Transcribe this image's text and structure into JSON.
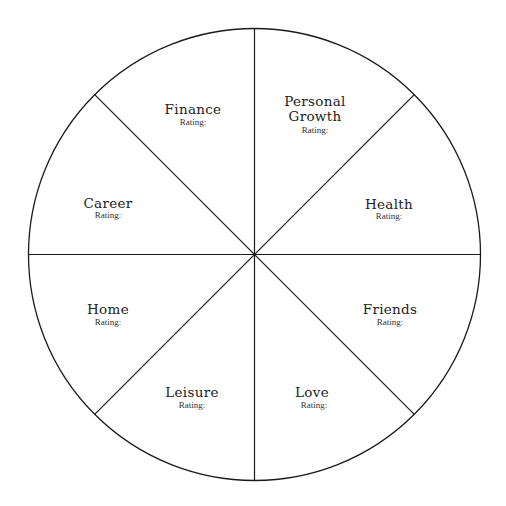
{
  "diagram": {
    "type": "wheel-of-life",
    "colors": {
      "line": "#1a1a1a",
      "background": "#ffffff",
      "text": "#222222"
    },
    "segments": [
      {
        "id": "finance",
        "title_lines": [
          "Finance"
        ],
        "rating_label": "Rating:"
      },
      {
        "id": "personal-growth",
        "title_lines": [
          "Personal",
          "Growth"
        ],
        "rating_label": "Rating:"
      },
      {
        "id": "health",
        "title_lines": [
          "Health"
        ],
        "rating_label": "Rating:"
      },
      {
        "id": "friends",
        "title_lines": [
          "Friends"
        ],
        "rating_label": "Rating:"
      },
      {
        "id": "love",
        "title_lines": [
          "Love"
        ],
        "rating_label": "Rating:"
      },
      {
        "id": "leisure",
        "title_lines": [
          "Leisure"
        ],
        "rating_label": "Rating:"
      },
      {
        "id": "home",
        "title_lines": [
          "Home"
        ],
        "rating_label": "Rating:"
      },
      {
        "id": "career",
        "title_lines": [
          "Career"
        ],
        "rating_label": "Rating:"
      }
    ]
  }
}
